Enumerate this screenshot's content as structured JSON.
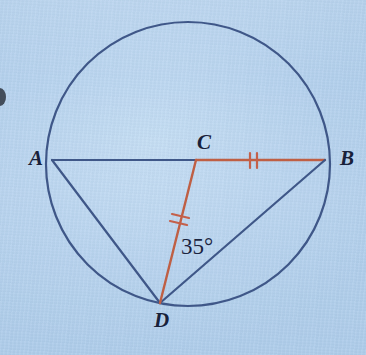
{
  "figure": {
    "kind": "circle-geometry-diagram",
    "background_color": "#b6d2ee",
    "circle": {
      "center_x": 188,
      "center_y": 164,
      "radius": 142,
      "stroke_color": "#3f5788",
      "stroke_width": 2.2
    },
    "points": {
      "A": {
        "x": 52,
        "y": 160
      },
      "B": {
        "x": 325,
        "y": 160
      },
      "C": {
        "x": 196,
        "y": 160
      },
      "D": {
        "x": 160,
        "y": 303
      }
    },
    "segments": [
      {
        "name": "AC",
        "from": "A",
        "to": "C",
        "color": "#3f5788",
        "width": 2.2,
        "ticks": 0
      },
      {
        "name": "CB",
        "from": "C",
        "to": "B",
        "color": "#bf5f44",
        "width": 2.4,
        "ticks": 2
      },
      {
        "name": "AD",
        "from": "A",
        "to": "D",
        "color": "#3f5788",
        "width": 2.2,
        "ticks": 0
      },
      {
        "name": "DB",
        "from": "D",
        "to": "B",
        "color": "#3f5788",
        "width": 2.2,
        "ticks": 0
      },
      {
        "name": "CD",
        "from": "C",
        "to": "D",
        "color": "#bf5f44",
        "width": 2.4,
        "ticks": 2
      }
    ],
    "tick_color": "#c4604a",
    "labels": {
      "A": "A",
      "B": "B",
      "C": "C",
      "D": "D"
    },
    "angle": {
      "text": "35°",
      "value": 35,
      "unit": "degrees",
      "at_vertex": "D",
      "between": "CD and DB"
    }
  },
  "chart_data": {
    "type": "diagram",
    "title": "",
    "shape": "circle with inscribed chords",
    "labels": [
      "A",
      "B",
      "C",
      "D",
      "35°"
    ],
    "annotations": [
      "segment CB marked with double tick",
      "segment CD marked with double tick",
      "angle at D measures 35 degrees"
    ]
  }
}
